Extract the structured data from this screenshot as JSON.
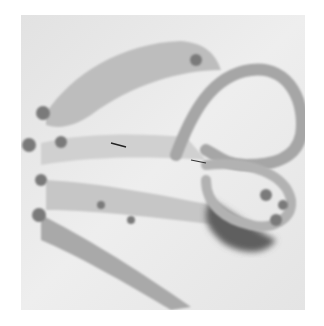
{
  "image": {
    "description": "Grayscale photograph of stitched fabric strips and twisted rope loops on a light cloth background",
    "colors": {
      "background": "#ffffff",
      "cloth": "#e9e9e9",
      "fabric_strip": "#b8b8b8",
      "rope": "#a8a8a8",
      "shadow": "#6a6a6a",
      "knots": "#7a7a7a"
    }
  }
}
